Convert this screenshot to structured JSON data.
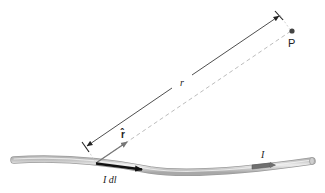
{
  "diagram": {
    "labels": {
      "point": "P",
      "distance": "r",
      "unit_vector": "r̂",
      "current_element": "I dl⃗",
      "current": "I"
    },
    "colors": {
      "wire_fill": "#d4d4d4",
      "wire_edge": "#9a9a9a",
      "arrow_black": "#111111",
      "arrow_gray": "#7a7a7a",
      "current_marker": "#6f6f6f",
      "dashed_line": "#bdbdbd",
      "point": "#444444"
    }
  }
}
